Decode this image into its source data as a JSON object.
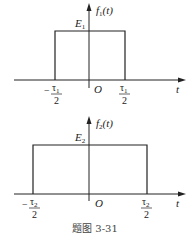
{
  "plots": [
    {
      "id": "f1",
      "ylabel_func": "f",
      "ylabel_sub": "1",
      "ylabel_arg": "(t)",
      "amplitude_label": "E",
      "amplitude_sub": "1",
      "xlabel": "t",
      "origin_label": "O",
      "left_tick": {
        "sign": "−",
        "num": "τ",
        "num_sub": "1",
        "den": "2"
      },
      "right_tick": {
        "sign": "",
        "num": "τ",
        "num_sub": "1",
        "den": "2"
      },
      "pulse": {
        "from": "-τ1/2",
        "to": "τ1/2",
        "height": "E1"
      }
    },
    {
      "id": "f2",
      "ylabel_func": "f",
      "ylabel_sub": "2",
      "ylabel_arg": "(t)",
      "amplitude_label": "E",
      "amplitude_sub": "2",
      "xlabel": "t",
      "origin_label": "O",
      "left_tick": {
        "sign": "−",
        "num": "τ",
        "num_sub": "2",
        "den": "2"
      },
      "right_tick": {
        "sign": "",
        "num": "τ",
        "num_sub": "2",
        "den": "2"
      },
      "pulse": {
        "from": "-τ2/2",
        "to": "τ2/2",
        "height": "E2"
      }
    }
  ],
  "caption": "题图 3-31"
}
